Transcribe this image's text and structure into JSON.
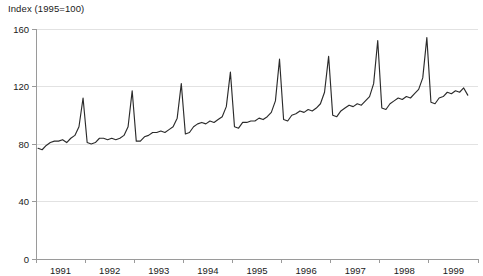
{
  "chart_data": {
    "type": "line",
    "title": "Index (1995=100)",
    "xlabel": "",
    "ylabel": "",
    "ylim": [
      0,
      160
    ],
    "yticks": [
      0,
      40,
      80,
      120,
      160
    ],
    "ytick_labels": [
      "0",
      "40",
      "80",
      "120",
      "160"
    ],
    "grid": true,
    "grid_axis": "y",
    "legend": "none",
    "line_color": "#2b2b2b",
    "axis_color": "#9a9a9a",
    "grid_color": "#e2e2e2",
    "background_color": "#ffffff",
    "xlim": [
      "1991-01",
      "1999-12"
    ],
    "xtick_labels": [
      "1991",
      "1992",
      "1993",
      "1994",
      "1995",
      "1996",
      "1997",
      "1998",
      "1999"
    ],
    "x_frequency": "monthly",
    "series": [
      {
        "name": "Index (1995=100)",
        "x": [
          "1991-01",
          "1991-02",
          "1991-03",
          "1991-04",
          "1991-05",
          "1991-06",
          "1991-07",
          "1991-08",
          "1991-09",
          "1991-10",
          "1991-11",
          "1991-12",
          "1992-01",
          "1992-02",
          "1992-03",
          "1992-04",
          "1992-05",
          "1992-06",
          "1992-07",
          "1992-08",
          "1992-09",
          "1992-10",
          "1992-11",
          "1992-12",
          "1993-01",
          "1993-02",
          "1993-03",
          "1993-04",
          "1993-05",
          "1993-06",
          "1993-07",
          "1993-08",
          "1993-09",
          "1993-10",
          "1993-11",
          "1993-12",
          "1994-01",
          "1994-02",
          "1994-03",
          "1994-04",
          "1994-05",
          "1994-06",
          "1994-07",
          "1994-08",
          "1994-09",
          "1994-10",
          "1994-11",
          "1994-12",
          "1995-01",
          "1995-02",
          "1995-03",
          "1995-04",
          "1995-05",
          "1995-06",
          "1995-07",
          "1995-08",
          "1995-09",
          "1995-10",
          "1995-11",
          "1995-12",
          "1996-01",
          "1996-02",
          "1996-03",
          "1996-04",
          "1996-05",
          "1996-06",
          "1996-07",
          "1996-08",
          "1996-09",
          "1996-10",
          "1996-11",
          "1996-12",
          "1997-01",
          "1997-02",
          "1997-03",
          "1997-04",
          "1997-05",
          "1997-06",
          "1997-07",
          "1997-08",
          "1997-09",
          "1997-10",
          "1997-11",
          "1997-12",
          "1998-01",
          "1998-02",
          "1998-03",
          "1998-04",
          "1998-05",
          "1998-06",
          "1998-07",
          "1998-08",
          "1998-09",
          "1998-10",
          "1998-11",
          "1998-12",
          "1999-01",
          "1999-02",
          "1999-03",
          "1999-04",
          "1999-05",
          "1999-06",
          "1999-07",
          "1999-08",
          "1999-09",
          "1999-10"
        ],
        "values": [
          77,
          76,
          79,
          81,
          82,
          82,
          83,
          81,
          84,
          86,
          92,
          112,
          81,
          80,
          81,
          84,
          84,
          83,
          84,
          83,
          84,
          86,
          92,
          117,
          82,
          82,
          85,
          86,
          88,
          88,
          89,
          88,
          90,
          92,
          98,
          122,
          87,
          88,
          92,
          94,
          95,
          94,
          96,
          95,
          97,
          99,
          106,
          130,
          92,
          91,
          95,
          95,
          96,
          96,
          98,
          97,
          99,
          102,
          110,
          139,
          97,
          96,
          100,
          101,
          103,
          102,
          104,
          103,
          105,
          108,
          116,
          141,
          100,
          99,
          103,
          105,
          107,
          106,
          108,
          107,
          110,
          113,
          122,
          152,
          105,
          104,
          108,
          110,
          112,
          111,
          113,
          112,
          115,
          118,
          126,
          154,
          109,
          108,
          112,
          113,
          116,
          115,
          117,
          116,
          119,
          114
        ]
      }
    ]
  },
  "axes": {
    "y_axis_name": "value-axis",
    "x_axis_name": "time-axis"
  }
}
